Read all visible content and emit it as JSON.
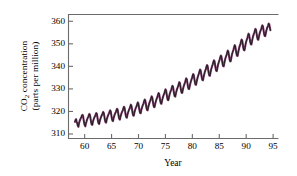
{
  "chart_data": {
    "type": "line",
    "title": "",
    "subtitle": "",
    "xlabel": "Year",
    "ylabel_line1": "CO2 concentration",
    "ylabel_line2": "(parts per million)",
    "ylabel_full": "CO2 concentration (parts per million)",
    "xlim": [
      1957.0,
      1996.0
    ],
    "ylim": [
      308.0,
      363.0
    ],
    "xticks": [
      60,
      65,
      70,
      75,
      80,
      85,
      90,
      95
    ],
    "xtick_labels": [
      "60",
      "65",
      "70",
      "75",
      "80",
      "85",
      "90",
      "95"
    ],
    "yticks": [
      310,
      320,
      330,
      340,
      350,
      360
    ],
    "ytick_labels": [
      "310",
      "320",
      "330",
      "340",
      "350",
      "360"
    ],
    "grid": false,
    "legend": null,
    "line_color": "#7a3d6b",
    "marker_color": "#1a1a1a",
    "axis_color": "#6b6b6b",
    "x_units": "year (last two digits of 19xx)",
    "y_units": "parts per million",
    "series": [
      {
        "name": "Atmospheric CO2 (Mauna Loa, monthly mean)",
        "x_start": 1958.2,
        "x_end": 1994.5,
        "x_step": 0.0833,
        "values": [
          315.4,
          316.2,
          316.6,
          315.4,
          314.7,
          313.7,
          313.2,
          314.8,
          315.6,
          316.4,
          316.9,
          317.5,
          318.2,
          318.5,
          318.0,
          316.4,
          314.8,
          313.9,
          313.4,
          314.7,
          315.5,
          316.4,
          317.0,
          317.6,
          318.3,
          318.9,
          318.4,
          316.9,
          315.2,
          314.2,
          314.0,
          315.3,
          316.2,
          317.0,
          317.5,
          318.0,
          318.7,
          319.3,
          318.9,
          317.3,
          315.7,
          314.7,
          314.4,
          315.7,
          316.6,
          317.4,
          318.0,
          318.5,
          319.2,
          319.8,
          319.3,
          317.8,
          316.2,
          315.2,
          315.0,
          316.3,
          317.2,
          318.0,
          318.6,
          319.1,
          319.9,
          320.5,
          320.1,
          318.5,
          316.9,
          315.9,
          315.7,
          317.0,
          317.9,
          318.7,
          319.3,
          319.8,
          320.6,
          321.2,
          320.8,
          319.2,
          317.6,
          316.6,
          316.4,
          317.7,
          318.6,
          319.4,
          320.0,
          320.5,
          321.4,
          322.1,
          321.6,
          320.0,
          318.4,
          317.4,
          317.2,
          318.5,
          319.4,
          320.2,
          320.9,
          321.4,
          322.3,
          323.0,
          322.5,
          320.9,
          319.2,
          318.2,
          318.1,
          319.4,
          320.4,
          321.2,
          321.9,
          322.4,
          323.3,
          324.0,
          323.5,
          321.9,
          320.3,
          319.3,
          319.2,
          320.5,
          321.5,
          322.3,
          323.0,
          323.6,
          324.6,
          325.3,
          324.9,
          323.3,
          321.6,
          320.6,
          320.5,
          321.8,
          322.8,
          323.7,
          324.4,
          325.0,
          325.9,
          326.7,
          326.3,
          324.7,
          323.0,
          322.0,
          321.9,
          323.2,
          324.2,
          325.1,
          325.8,
          326.4,
          327.4,
          328.2,
          327.8,
          326.2,
          324.5,
          323.5,
          323.4,
          324.7,
          325.8,
          326.7,
          327.4,
          328.0,
          329.0,
          329.8,
          329.4,
          327.8,
          326.1,
          325.1,
          325.0,
          326.3,
          327.4,
          328.3,
          329.0,
          329.6,
          330.6,
          331.4,
          331.0,
          329.4,
          327.7,
          326.7,
          326.6,
          327.9,
          329.0,
          329.9,
          330.6,
          331.2,
          332.2,
          333.0,
          332.6,
          331.0,
          329.3,
          328.3,
          328.2,
          329.5,
          330.6,
          331.5,
          332.2,
          332.9,
          333.9,
          334.7,
          334.3,
          332.7,
          331.0,
          330.0,
          329.9,
          331.2,
          332.3,
          333.3,
          334.1,
          334.8,
          335.8,
          336.6,
          336.2,
          334.6,
          332.9,
          331.9,
          331.8,
          333.1,
          334.3,
          335.3,
          336.1,
          336.8,
          337.8,
          338.6,
          338.2,
          336.6,
          334.9,
          333.9,
          333.8,
          335.1,
          336.3,
          337.3,
          338.1,
          338.8,
          339.8,
          340.6,
          340.2,
          338.6,
          336.9,
          335.9,
          335.8,
          337.1,
          338.4,
          339.4,
          340.2,
          340.9,
          341.9,
          342.7,
          342.3,
          340.7,
          339.0,
          338.0,
          337.9,
          339.2,
          340.5,
          341.5,
          342.3,
          343.0,
          344.0,
          344.8,
          344.4,
          342.8,
          341.1,
          340.1,
          340.0,
          341.3,
          342.6,
          343.6,
          344.4,
          345.1,
          346.1,
          347.0,
          346.6,
          345.0,
          343.3,
          342.3,
          342.2,
          343.5,
          344.9,
          345.9,
          346.7,
          347.5,
          348.5,
          349.4,
          349.0,
          347.4,
          345.7,
          344.7,
          344.6,
          345.9,
          347.3,
          348.4,
          349.2,
          350.0,
          351.0,
          351.9,
          351.5,
          349.9,
          348.2,
          347.2,
          347.1,
          348.4,
          349.9,
          351.0,
          351.8,
          352.6,
          353.6,
          354.5,
          354.1,
          352.5,
          350.8,
          349.8,
          349.7,
          351.0,
          352.4,
          353.4,
          354.2,
          354.9,
          355.8,
          356.6,
          356.2,
          354.6,
          352.9,
          351.9,
          351.8,
          353.1,
          354.3,
          355.2,
          355.9,
          356.5,
          357.4,
          358.2,
          357.8,
          356.2,
          354.5,
          353.5,
          353.4,
          354.7,
          355.9,
          356.8,
          357.5,
          358.1,
          359.0,
          358.6,
          357.2,
          356.0
        ]
      }
    ]
  }
}
